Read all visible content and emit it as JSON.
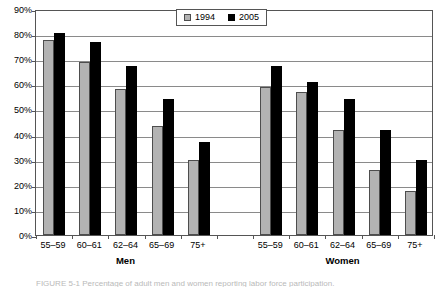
{
  "chart_data": {
    "type": "bar",
    "title": "",
    "subtitle": "",
    "xlabel": "",
    "ylabel": "",
    "ylim": [
      0,
      90
    ],
    "ytick_values": [
      0,
      10,
      20,
      30,
      40,
      50,
      60,
      70,
      80,
      90
    ],
    "ytick_labels": [
      "0%",
      "10%",
      "20%",
      "30%",
      "40%",
      "50%",
      "60%",
      "70%",
      "80%",
      "90%"
    ],
    "grid": "horizontal",
    "legend_position": "top-center",
    "categories": [
      "55–59",
      "60–61",
      "62–64",
      "65–69",
      "75+"
    ],
    "groups": [
      {
        "name": "Men",
        "categories": [
          "55–59",
          "60–61",
          "62–64",
          "65–69",
          "75+"
        ],
        "series": [
          {
            "name": "1994",
            "color": "#b3b3b3",
            "values": [
              77.5,
              69,
              58,
              43.5,
              30
            ]
          },
          {
            "name": "2005",
            "color": "#000000",
            "values": [
              80.5,
              77,
              67.5,
              54,
              37
            ]
          }
        ]
      },
      {
        "name": "Women",
        "categories": [
          "55–59",
          "60–61",
          "62–64",
          "65–69",
          "75+"
        ],
        "series": [
          {
            "name": "1994",
            "color": "#b3b3b3",
            "values": [
              59,
              57,
              42,
              26,
              17.5
            ]
          },
          {
            "name": "2005",
            "color": "#000000",
            "values": [
              67.5,
              61,
              54,
              42,
              30
            ]
          }
        ]
      }
    ],
    "legend": [
      {
        "label": "1994",
        "color": "#b3b3b3"
      },
      {
        "label": "2005",
        "color": "#000000"
      }
    ]
  },
  "legend": {
    "entries": [
      {
        "label": "1994"
      },
      {
        "label": "2005"
      }
    ]
  },
  "axis": {
    "y_labels": [
      "90%",
      "80%",
      "70%",
      "60%",
      "50%",
      "40%",
      "30%",
      "20%",
      "10%",
      "0%"
    ]
  },
  "group_labels": [
    "Men",
    "Women"
  ],
  "caption": {
    "text": "FIGURE 5-1  Percentage of adult men and women reporting labor force participation."
  },
  "colors": {
    "series_1994": "#b3b3b3",
    "series_2005": "#000000",
    "gridline": "#8a8a8a",
    "frame": "#555555",
    "background": "#ffffff"
  }
}
